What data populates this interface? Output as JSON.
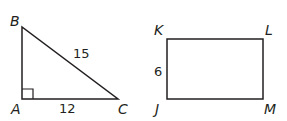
{
  "triangle": {
    "vertices": {
      "A": "A",
      "B": "B",
      "C": "C"
    },
    "right_angle_at": "A",
    "sides": {
      "BC": "15",
      "AC": "12"
    }
  },
  "rectangle": {
    "vertices": {
      "K": "K",
      "L": "L",
      "J": "J",
      "M": "M"
    },
    "sides": {
      "KJ": "6"
    }
  },
  "colors": {
    "stroke": "#231f20",
    "background": "#ffffff"
  }
}
